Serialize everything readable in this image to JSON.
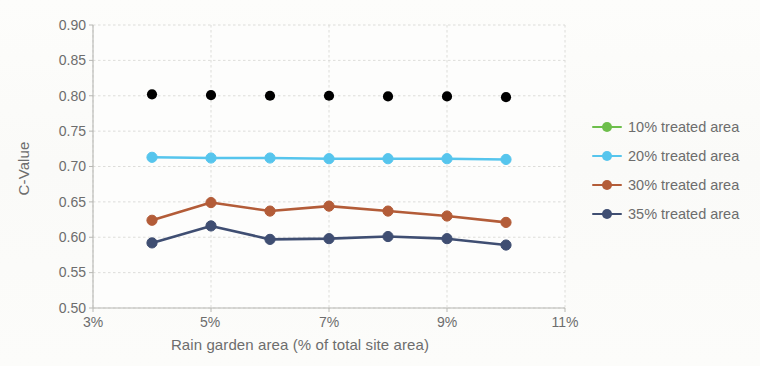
{
  "chart_data": {
    "type": "line",
    "title": "",
    "xlabel": "Rain garden area (% of total site area)",
    "ylabel": "C-Value",
    "x": [
      4,
      5,
      6,
      7,
      8,
      9,
      10
    ],
    "xtick_labels": [
      "3%",
      "5%",
      "7%",
      "9%",
      "11%"
    ],
    "xtick_values": [
      3,
      5,
      7,
      9,
      11
    ],
    "ytick_labels": [
      "0.50",
      "0.55",
      "0.60",
      "0.65",
      "0.70",
      "0.75",
      "0.80",
      "0.85",
      "0.90"
    ],
    "ytick_values": [
      0.5,
      0.55,
      0.6,
      0.65,
      0.7,
      0.75,
      0.8,
      0.85,
      0.9
    ],
    "xlim": [
      3,
      11
    ],
    "ylim": [
      0.5,
      0.9
    ],
    "grid": true,
    "legend_position": "right",
    "series": [
      {
        "name": "10% treated area",
        "color": "#6DB churches",
        "values": [
          0.802,
          0.801,
          0.8,
          0.8,
          0.799,
          0.799,
          0.798
        ]
      },
      {
        "name": "20% treated area",
        "color": "#56C5ED",
        "values": [
          0.713,
          0.712,
          0.712,
          0.711,
          0.711,
          0.711,
          0.71
        ]
      },
      {
        "name": "30% treated area",
        "color": "#B35C38",
        "values": [
          0.624,
          0.649,
          0.637,
          0.644,
          0.637,
          0.63,
          0.621
        ]
      },
      {
        "name": "35% treated area",
        "color": "#3F4E72",
        "values": [
          0.592,
          0.616,
          0.597,
          0.598,
          0.601,
          0.598,
          0.589
        ]
      }
    ]
  },
  "legend": {
    "entries": [
      {
        "label": "10% treated area",
        "color": "#6DBE4B"
      },
      {
        "label": "20% treated area",
        "color": "#56C5ED"
      },
      {
        "label": "30% treated area",
        "color": "#B35C38"
      },
      {
        "label": "35% treated area",
        "color": "#3F4E72"
      }
    ]
  },
  "colors": {
    "series_10": "#6DBE4B",
    "series_20": "#56C5ED",
    "series_30": "#B35C38",
    "series_35": "#3F4E72",
    "grid": "#d9d9d6",
    "axis": "#b8b8b4",
    "text": "#6d6d6d",
    "background": "#fbfbf9"
  }
}
